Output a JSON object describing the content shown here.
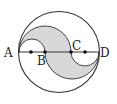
{
  "diagram": {
    "points": [
      {
        "label": "A",
        "x": 19
      },
      {
        "label": "B",
        "x": 45
      },
      {
        "label": "C",
        "x": 71
      },
      {
        "label": "D",
        "x": 99
      }
    ],
    "unlabeled_points_x": [
      31,
      85
    ],
    "colors": {
      "stroke": "#333333",
      "shade": "#d9d9d9",
      "background": "#ffffff"
    },
    "labels": {
      "A": "A",
      "B": "B",
      "C": "C",
      "D": "D"
    }
  }
}
